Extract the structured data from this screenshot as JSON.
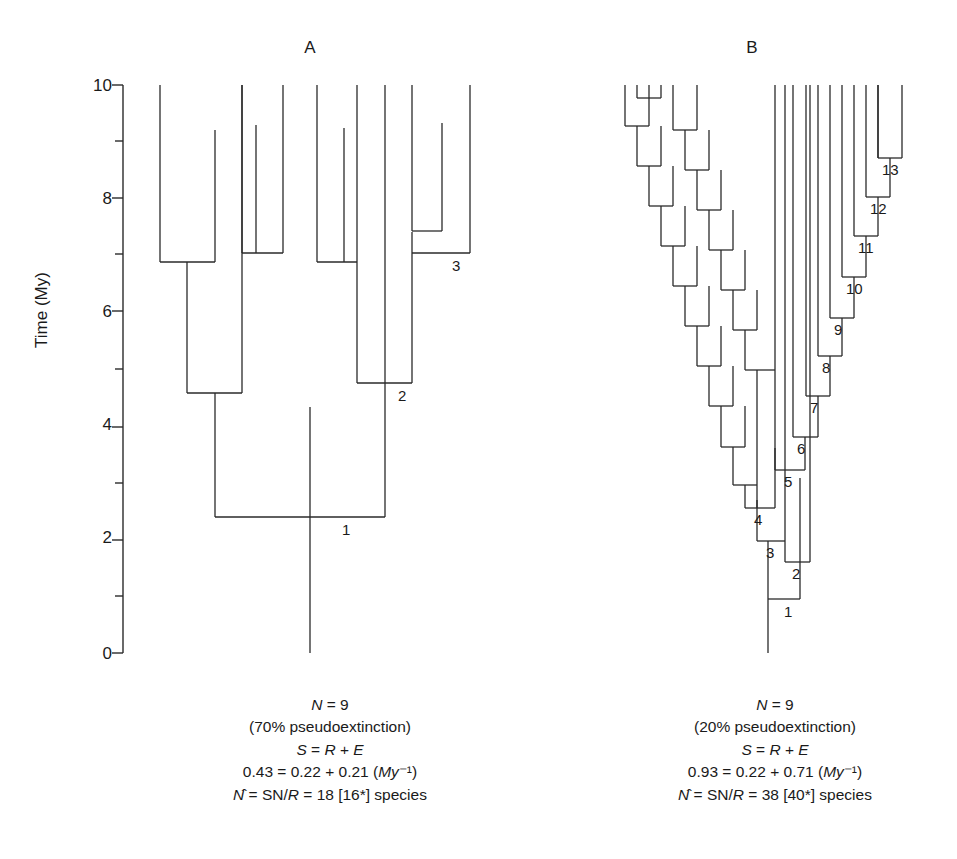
{
  "figure": {
    "axis": {
      "title": "Time (My)",
      "major_ticks": [
        "10",
        "8",
        "6",
        "4",
        "2",
        "0"
      ],
      "tick_values": [
        10,
        8,
        6,
        4,
        2,
        0
      ],
      "minor_tick_values": [
        9,
        7,
        5,
        3,
        1
      ],
      "range": [
        0,
        10
      ],
      "units": "My"
    },
    "panels": [
      {
        "id": "A",
        "label": "A",
        "caption": {
          "line1": "N = 9",
          "line2": "(70% pseudoextinction)",
          "line3": "S = R + E",
          "line4": "0.43 = 0.22 + 0.21 (My⁻¹)",
          "line5": "N̂ = SN/R = 18 [16*] species"
        },
        "stats": {
          "N": 9,
          "pseudoextinction_percent": 70,
          "S": 0.43,
          "R": 0.22,
          "E": 0.21,
          "N_hat": 18,
          "N_hat_alt": 16
        },
        "node_labels": [
          {
            "text": "1",
            "x": 342,
            "y": 530
          },
          {
            "text": "2",
            "x": 398,
            "y": 396
          },
          {
            "text": "3",
            "x": 452,
            "y": 266
          }
        ]
      },
      {
        "id": "B",
        "label": "B",
        "caption": {
          "line1": "N = 9",
          "line2": "(20% pseudoextinction)",
          "line3": "S = R + E",
          "line4": "0.93 = 0.22 + 0.71 (My⁻¹)",
          "line5": "N̂ = SN/R = 38 [40*] species"
        },
        "stats": {
          "N": 9,
          "pseudoextinction_percent": 20,
          "S": 0.93,
          "R": 0.22,
          "E": 0.71,
          "N_hat": 38,
          "N_hat_alt": 40
        },
        "node_labels": [
          {
            "text": "1",
            "x": 784,
            "y": 629
          },
          {
            "text": "2",
            "x": 792,
            "y": 590
          },
          {
            "text": "3",
            "x": 771,
            "y": 551
          },
          {
            "text": "4",
            "x": 767,
            "y": 517
          },
          {
            "text": "5",
            "x": 792,
            "y": 460
          },
          {
            "text": "6",
            "x": 805,
            "y": 426
          },
          {
            "text": "7",
            "x": 818,
            "y": 385
          },
          {
            "text": "8",
            "x": 828,
            "y": 345
          },
          {
            "text": "9",
            "x": 840,
            "y": 307
          },
          {
            "text": "10",
            "x": 849,
            "y": 265
          },
          {
            "text": "11",
            "x": 866,
            "y": 224
          },
          {
            "text": "12",
            "x": 878,
            "y": 185
          },
          {
            "text": "13",
            "x": 890,
            "y": 148
          }
        ]
      }
    ]
  },
  "chart_data": {
    "type": "line",
    "title": "",
    "subtitle": "",
    "xlabel": "",
    "ylabel": "Time (My)",
    "ylim": [
      0,
      10
    ],
    "grid": false,
    "legend": "none",
    "panels": [
      {
        "name": "A",
        "extant_lineages": 9,
        "pseudoextinction_percent": 70,
        "speciation_rate_S": 0.43,
        "origination_rate_R": 0.22,
        "extinction_rate_E": 0.21,
        "estimated_species_N_hat": 18,
        "estimated_species_alt": 16,
        "branch_points_My": [
          2.4,
          4.78,
          7.05
        ],
        "tip_count": 9
      },
      {
        "name": "B",
        "extant_lineages": 9,
        "pseudoextinction_percent": 20,
        "speciation_rate_S": 0.93,
        "origination_rate_R": 0.22,
        "extinction_rate_E": 0.71,
        "estimated_species_N_hat": 38,
        "estimated_species_alt": 40,
        "branch_points_My": [
          0.95,
          1.6,
          2.3,
          2.9,
          3.5,
          4.1,
          4.8,
          5.5,
          6.2,
          6.95,
          7.65,
          8.35,
          9.0
        ],
        "tip_count": 9
      }
    ]
  }
}
